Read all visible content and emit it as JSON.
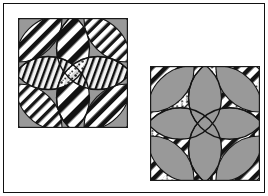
{
  "figure": {
    "background_color": "#ffffff",
    "border_color": "#111111",
    "border_width_px": 1.5,
    "width_px": 268,
    "height_px": 196
  },
  "palette": {
    "gray": "#999999",
    "gray_dark": "#8a8a8a",
    "black": "#111111",
    "white": "#ffffff",
    "outline": "#1a1a1a"
  },
  "blocks": [
    {
      "id": "block-left",
      "name": "left-quilt-block",
      "label": "Double Wedding Ring block, gray ground",
      "x_px": 14,
      "y_px": 14,
      "width_px": 110,
      "height_px": 110,
      "background_fill": "#999999",
      "ring_fill": "patterned",
      "center_fill": "patterned",
      "petal_fill": "patterned",
      "description": "Four overlapping circles form a ring lattice; corner and edge petals plus the central melon shapes are filled with black-and-white diagonal stripe and print fabrics over a solid gray ground.",
      "pattern_variant": "stripes-on-gray"
    },
    {
      "id": "block-right",
      "name": "right-quilt-block",
      "label": "Double Wedding Ring block, pieced ground (tonal inverse)",
      "x_px": 146,
      "y_px": 62,
      "width_px": 110,
      "height_px": 115,
      "background_fill": "patterned",
      "ring_fill": "#999999",
      "center_fill": "#999999",
      "petal_fill": "#999999",
      "description": "Same four-circle ring lattice with the values reversed: the ground is black-and-white diagonal stripe and print fabric while the petals, ring arcs and the concave-diamond center are solid gray.",
      "pattern_variant": "gray-on-stripes"
    }
  ],
  "geometry": {
    "circle_count": 4,
    "circle_radius_ratio": 0.375,
    "circle_centers_ratio": [
      [
        0.275,
        0.275
      ],
      [
        0.725,
        0.275
      ],
      [
        0.275,
        0.725
      ],
      [
        0.725,
        0.725
      ]
    ],
    "stripe_angle_deg": 45,
    "stripe_period_px": 7
  }
}
